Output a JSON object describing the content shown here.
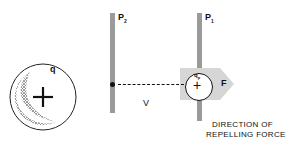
{
  "diagram": {
    "source_charge": {
      "label": "q",
      "sign": "+"
    },
    "plates": [
      {
        "id": "P2",
        "label": "P",
        "sub": "2"
      },
      {
        "id": "P1",
        "label": "P",
        "sub": "1"
      }
    ],
    "test_charge": {
      "label": "q",
      "sub": "p",
      "sign": "+"
    },
    "potential_label": "V",
    "force_label": "F",
    "caption_line1": "DIRECTION OF",
    "caption_line2": "REPELLING FORCE",
    "colors": {
      "plate": "#9a9a9a",
      "arrow": "#d6d6d6",
      "stroke": "#111111"
    }
  }
}
